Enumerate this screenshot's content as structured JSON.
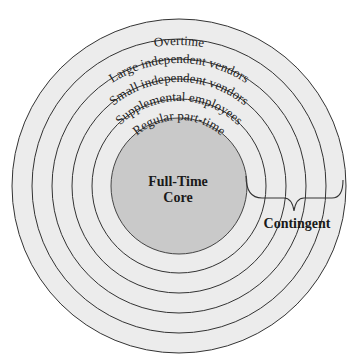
{
  "diagram": {
    "rings": [
      {
        "label": "Overtime",
        "radius": 167
      },
      {
        "label": "Large independent vendors",
        "radius": 147
      },
      {
        "label": "Small independent vendors",
        "radius": 127
      },
      {
        "label": "Supplemental employees",
        "radius": 107
      },
      {
        "label": "Regular part-time",
        "radius": 87
      }
    ],
    "core": {
      "label_line1": "Full-Time",
      "label_line2": "Core",
      "radius": 68
    },
    "contingent": {
      "label": "Contingent"
    },
    "colors": {
      "ring_fill": "#ececec",
      "core_fill": "#c9c9c9",
      "stroke": "#333333",
      "background": "#ffffff"
    }
  }
}
